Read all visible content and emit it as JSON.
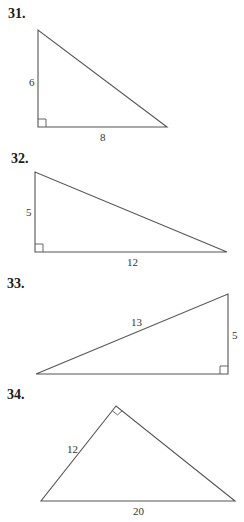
{
  "problems": [
    {
      "number": "31.",
      "labels": {
        "leg_vertical": "6",
        "leg_horizontal": "8"
      },
      "right_angle": "bottom-left"
    },
    {
      "number": "32.",
      "labels": {
        "leg_vertical": "5",
        "leg_horizontal": "12"
      },
      "right_angle": "bottom-left"
    },
    {
      "number": "33.",
      "labels": {
        "hypotenuse": "13",
        "leg_vertical": "5"
      },
      "right_angle": "bottom-right"
    },
    {
      "number": "34.",
      "labels": {
        "leg_left": "12",
        "hypotenuse": "20"
      },
      "right_angle": "top"
    }
  ],
  "colors": {
    "line": "#555555",
    "text": "#1a1a1a"
  }
}
